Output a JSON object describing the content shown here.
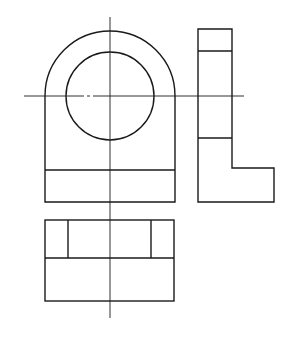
{
  "diagram": {
    "type": "orthographic-projection",
    "background": "#ffffff",
    "line_color": "#1a1a1a",
    "views": {
      "front_view": {
        "outer_arc": {
          "cx": 110,
          "cy": 96,
          "r": 65
        },
        "hole": {
          "cx": 110,
          "cy": 96,
          "r": 44
        },
        "body": {
          "x1": 45,
          "x2": 175,
          "y_arc": 96,
          "y_line": 170,
          "y_bottom": 202
        }
      },
      "side_view": {
        "x_left": 198,
        "x_right": 232,
        "x_step": 274,
        "y_top": 29,
        "y_line1": 51,
        "y_line2": 138,
        "y_step": 168,
        "y_bottom": 202
      },
      "top_view": {
        "x_left": 45,
        "x_right": 174,
        "x_in_left": 68,
        "x_in_right": 151,
        "y_top": 220,
        "y_mid": 258,
        "y_bottom": 301
      }
    },
    "center_lines": {
      "vertical": {
        "x": 110,
        "y1": 17,
        "y2": 318
      },
      "horizontal": {
        "y": 96,
        "x1": 24,
        "x2": 244
      }
    }
  }
}
